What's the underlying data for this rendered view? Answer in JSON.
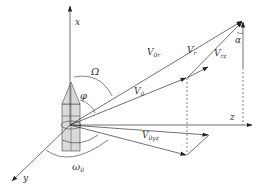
{
  "diagram": {
    "title": "",
    "axes": {
      "x": {
        "label": "x"
      },
      "y": {
        "label": "y"
      },
      "z": {
        "label": "z"
      }
    },
    "vectors": [
      {
        "id": "V0r",
        "label": "V",
        "subscript": "0r"
      },
      {
        "id": "Vr",
        "label": "V",
        "subscript": "r"
      },
      {
        "id": "Vrz",
        "label": "V",
        "subscript": "rz"
      },
      {
        "id": "V0",
        "label": "V",
        "subscript": "0"
      },
      {
        "id": "V0yz",
        "label": "V",
        "subscript": "0yz"
      }
    ],
    "angles": [
      {
        "id": "Omega",
        "label": "Ω"
      },
      {
        "id": "phi",
        "label": "φ"
      },
      {
        "id": "omega0",
        "label": "ω",
        "subscript": "0"
      },
      {
        "id": "alpha",
        "label": "α"
      }
    ],
    "colors": {
      "line": "#333333",
      "projectile_fill": "#d9d9d9",
      "background": "#ffffff"
    }
  }
}
